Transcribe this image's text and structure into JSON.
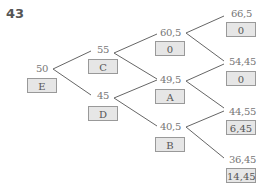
{
  "question_number": "43",
  "nodes": {
    "E": {
      "value": "50",
      "label": "E"
    },
    "C": {
      "value": "55",
      "label": "C"
    },
    "D": {
      "value": "45",
      "label": "D"
    },
    "n605": {
      "value": "60,5",
      "label": "0"
    },
    "A": {
      "value": "49,5",
      "label": "A"
    },
    "B": {
      "value": "40,5",
      "label": "B"
    },
    "n665": {
      "value": "66,5",
      "label": "0"
    },
    "n5445": {
      "value": "54,45",
      "label": "0"
    },
    "n4455": {
      "value": "44,55",
      "label": "6,45"
    },
    "n3645": {
      "value": "36,45",
      "label": "14,45"
    }
  }
}
